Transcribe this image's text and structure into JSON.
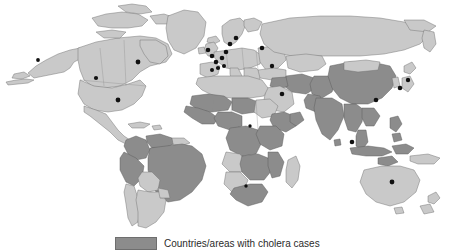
{
  "figure": {
    "type": "choropleth-world-map",
    "background_color": "#ffffff"
  },
  "legend": {
    "swatch_color": "#8c8c8c",
    "label": "Countries/areas with cholera cases"
  },
  "map": {
    "shading": {
      "affected_color": "#8c8c8c",
      "unaffected_color": "#c9c9c9",
      "border_color": "#6e6e6e",
      "dot_color": "#111111"
    },
    "regions_affected": [
      "Brazil",
      "Colombia",
      "Peru",
      "Venezuela",
      "Mauritania",
      "Senegal",
      "Guinea",
      "Sierra Leone",
      "Liberia",
      "Ivory Coast",
      "Ghana",
      "Togo",
      "Benin",
      "Nigeria",
      "Niger",
      "Chad",
      "Cameroon",
      "Central African Republic",
      "Democratic Republic of the Congo",
      "Congo",
      "Angola",
      "Zambia",
      "Zimbabwe",
      "Mozambique",
      "Malawi",
      "Tanzania",
      "Kenya",
      "Uganda",
      "Somalia",
      "Ethiopia",
      "South Africa",
      "Iran",
      "Iraq",
      "Afghanistan",
      "Pakistan",
      "India",
      "Nepal",
      "China",
      "Myanmar",
      "Thailand",
      "Viet Nam",
      "Laos",
      "Cambodia",
      "Malaysia",
      "Indonesia",
      "Philippines"
    ],
    "regions_unaffected": [
      "United States of America",
      "Canada",
      "Greenland",
      "Mexico",
      "Argentina",
      "Chile",
      "Bolivia",
      "Paraguay",
      "Uruguay",
      "Europe",
      "Russian Federation",
      "Australia",
      "New Zealand",
      "Japan",
      "Republic of Korea",
      "Saudi Arabia",
      "Egypt",
      "Libya",
      "Algeria",
      "Morocco",
      "Sudan",
      "Madagascar"
    ],
    "imported_case_markers": "black dots"
  }
}
